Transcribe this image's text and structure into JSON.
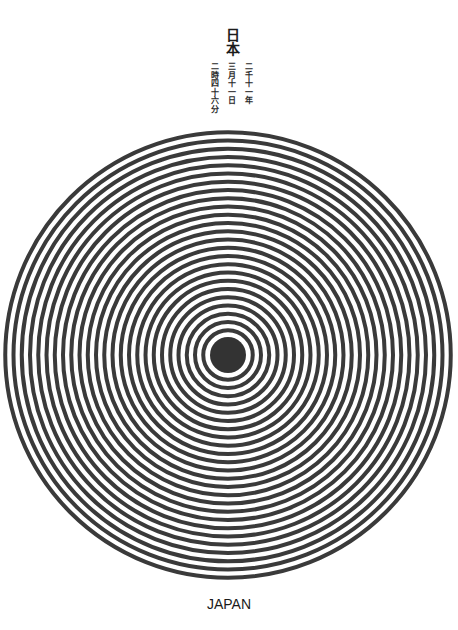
{
  "title": "日本",
  "date_columns": [
    "二千十一年",
    "三月十一日",
    "二時四十六分"
  ],
  "footer": "JAPAN",
  "graphic": {
    "type": "concentric-rings",
    "center": [
      228,
      355
    ],
    "core_radius": 18,
    "ring_count": 25,
    "ring_period": 8.25,
    "stroke_width": 4,
    "color": "#3a3a3a",
    "core_color": "#333333"
  }
}
